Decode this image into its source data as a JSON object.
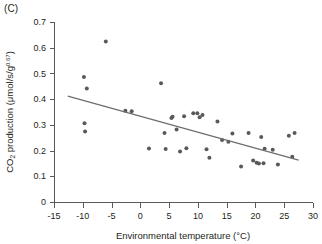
{
  "panel": {
    "label": "(C)"
  },
  "chart_data": {
    "type": "scatter",
    "title": "",
    "panel_label": "(C)",
    "xlabel": "Environmental temperature (°C)",
    "ylabel_prefix": "CO",
    "ylabel_sub": "2",
    "ylabel_rest": " production (μmol/s/g",
    "ylabel_sup": "0.67",
    "ylabel_close": ")",
    "ylabel_full": "CO2 production (μmol/s/g^0.67)",
    "xlim": [
      -15,
      30
    ],
    "ylim": [
      0,
      0.7
    ],
    "xticks": [
      -15,
      -10,
      -5,
      0,
      5,
      10,
      15,
      20,
      25,
      30
    ],
    "xticklabels": [
      "-15",
      "-10",
      "-5",
      "0",
      "5",
      "10",
      "15",
      "20",
      "25",
      "30"
    ],
    "yticks": [
      0,
      0.1,
      0.2,
      0.3,
      0.4,
      0.5,
      0.6,
      0.7
    ],
    "yticklabels": [
      "0",
      "0.1",
      "0.2",
      "0.3",
      "0.4",
      "0.5",
      "0.6",
      "0.7"
    ],
    "grid": false,
    "legend": false,
    "marker": "filled-circle",
    "marker_color": "#58595b",
    "marker_size": 2.0,
    "line_color": "#6d6e71",
    "axis_color": "#58595b",
    "series": [
      {
        "name": "CO2 production",
        "points": [
          [
            -9.8,
            0.486
          ],
          [
            -9.7,
            0.306
          ],
          [
            -9.6,
            0.274
          ],
          [
            -9.3,
            0.441
          ],
          [
            -6.0,
            0.624
          ],
          [
            -2.6,
            0.355
          ],
          [
            -1.5,
            0.353
          ],
          [
            1.5,
            0.208
          ],
          [
            3.6,
            0.462
          ],
          [
            4.2,
            0.268
          ],
          [
            4.4,
            0.206
          ],
          [
            5.4,
            0.327
          ],
          [
            5.6,
            0.332
          ],
          [
            6.3,
            0.282
          ],
          [
            6.9,
            0.196
          ],
          [
            7.6,
            0.333
          ],
          [
            8.0,
            0.209
          ],
          [
            9.2,
            0.345
          ],
          [
            9.9,
            0.345
          ],
          [
            10.3,
            0.33
          ],
          [
            10.8,
            0.338
          ],
          [
            11.5,
            0.205
          ],
          [
            12.0,
            0.172
          ],
          [
            13.4,
            0.313
          ],
          [
            14.2,
            0.241
          ],
          [
            15.3,
            0.234
          ],
          [
            16.0,
            0.266
          ],
          [
            17.5,
            0.138
          ],
          [
            18.8,
            0.268
          ],
          [
            19.6,
            0.161
          ],
          [
            20.2,
            0.153
          ],
          [
            20.6,
            0.15
          ],
          [
            21.0,
            0.253
          ],
          [
            21.4,
            0.151
          ],
          [
            21.6,
            0.207
          ],
          [
            23.0,
            0.203
          ],
          [
            23.9,
            0.146
          ],
          [
            25.8,
            0.258
          ],
          [
            26.4,
            0.176
          ],
          [
            26.8,
            0.268
          ]
        ]
      }
    ],
    "fit_line": {
      "name": "linear-regression",
      "x_start": -12.6,
      "y_start": 0.412,
      "x_end": 27.5,
      "y_end": 0.163
    }
  }
}
